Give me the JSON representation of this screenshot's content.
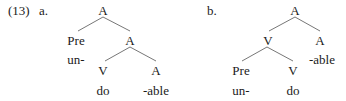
{
  "example": {
    "number": "(13)",
    "trees": [
      {
        "label": "a.",
        "nodes": {
          "root": "A",
          "left": "Pre",
          "left_morph": "un-",
          "right": "A",
          "right_left": "V",
          "right_left_morph": "do",
          "right_right": "A",
          "right_right_morph": "-able"
        }
      },
      {
        "label": "b.",
        "nodes": {
          "root": "A",
          "left": "V",
          "left_left": "Pre",
          "left_left_morph": "un-",
          "left_right": "V",
          "left_right_morph": "do",
          "right": "A",
          "right_morph": "-able"
        }
      }
    ]
  }
}
